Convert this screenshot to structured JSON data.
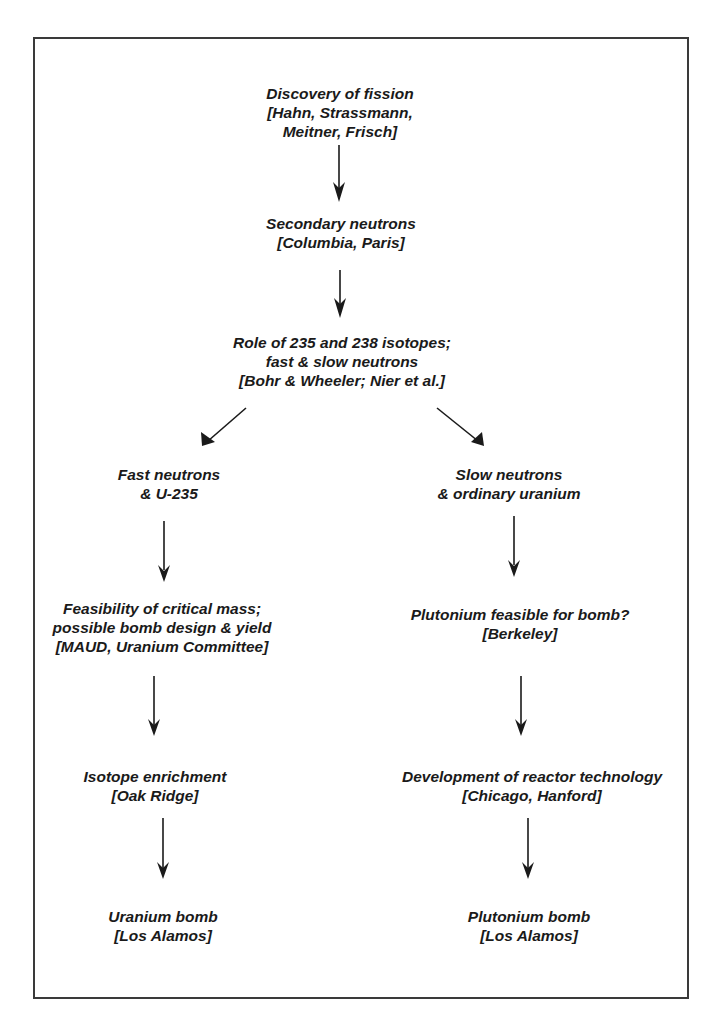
{
  "diagram": {
    "type": "flowchart",
    "nodes": [
      {
        "id": "n1",
        "lines": [
          "Discovery of fission",
          "[Hahn, Strassmann,",
          "Meitner, Frisch]"
        ]
      },
      {
        "id": "n2",
        "lines": [
          "Secondary neutrons",
          "[Columbia, Paris]"
        ]
      },
      {
        "id": "n3",
        "lines": [
          "Role of 235 and 238 isotopes;",
          "fast & slow neutrons",
          "[Bohr & Wheeler; Nier et al.]"
        ]
      },
      {
        "id": "n4",
        "lines": [
          "Fast neutrons",
          "& U-235"
        ]
      },
      {
        "id": "n5",
        "lines": [
          "Slow neutrons",
          "& ordinary uranium"
        ]
      },
      {
        "id": "n6",
        "lines": [
          "Feasibility of critical mass;",
          "possible bomb design & yield",
          "[MAUD, Uranium Committee]"
        ]
      },
      {
        "id": "n7",
        "lines": [
          "Plutonium feasible for bomb?",
          "[Berkeley]"
        ]
      },
      {
        "id": "n8",
        "lines": [
          "Isotope enrichment",
          "[Oak Ridge]"
        ]
      },
      {
        "id": "n9",
        "lines": [
          "Development of reactor technology",
          "[Chicago, Hanford]"
        ]
      },
      {
        "id": "n10",
        "lines": [
          "Uranium bomb",
          "[Los Alamos]"
        ]
      },
      {
        "id": "n11",
        "lines": [
          "Plutonium bomb",
          "[Los Alamos]"
        ]
      }
    ],
    "edges": [
      {
        "from": "n1",
        "to": "n2"
      },
      {
        "from": "n2",
        "to": "n3"
      },
      {
        "from": "n3",
        "to": "n4"
      },
      {
        "from": "n3",
        "to": "n5"
      },
      {
        "from": "n4",
        "to": "n6"
      },
      {
        "from": "n5",
        "to": "n7"
      },
      {
        "from": "n6",
        "to": "n8"
      },
      {
        "from": "n7",
        "to": "n9"
      },
      {
        "from": "n8",
        "to": "n10"
      },
      {
        "from": "n9",
        "to": "n11"
      }
    ]
  },
  "colors": {
    "line": "#1a1a1a",
    "frame": "#3a3a3a",
    "background": "#ffffff"
  }
}
